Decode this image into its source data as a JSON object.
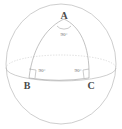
{
  "figure": {
    "type": "geometry-diagram",
    "canvas": {
      "width": 122,
      "height": 129
    },
    "background_color": "#ffffff",
    "line_color": "#b9b9b9",
    "label_color": "#4a4a4a",
    "angle_label_color": "#6a6a6a"
  },
  "sphere": {
    "name": "sphere-outline",
    "center_x": 61,
    "center_y": 64,
    "radius_x": 55,
    "radius_y": 60,
    "equator": {
      "name": "equator-ellipse",
      "center_y": 68,
      "radius_x": 55,
      "radius_y": 13,
      "front_style": "solid",
      "back_style": "dotted"
    }
  },
  "vertices": [
    {
      "id": "A",
      "label": "A",
      "x": 64,
      "y": 18,
      "label_x": 64,
      "label_y": 19
    },
    {
      "id": "B",
      "label": "B",
      "x": 29,
      "y": 77,
      "label_x": 27,
      "label_y": 89
    },
    {
      "id": "C",
      "label": "C",
      "x": 89,
      "y": 77,
      "label_x": 91,
      "label_y": 89
    }
  ],
  "angles": [
    {
      "at": "A",
      "label": "90°",
      "value": 90,
      "unit": "degrees",
      "marker": "arc",
      "label_x": 64,
      "label_y": 36
    },
    {
      "at": "B",
      "label": "90°",
      "value": 90,
      "unit": "degrees",
      "marker": "square",
      "label_x": 42,
      "label_y": 72
    },
    {
      "at": "C",
      "label": "90°",
      "value": 90,
      "unit": "degrees",
      "marker": "square",
      "label_x": 78,
      "label_y": 72
    }
  ],
  "edges": [
    {
      "name": "arc-A-B",
      "from": "A",
      "to": "B"
    },
    {
      "name": "arc-A-C",
      "from": "A",
      "to": "C"
    },
    {
      "name": "arc-B-C",
      "from": "B",
      "to": "C"
    }
  ]
}
